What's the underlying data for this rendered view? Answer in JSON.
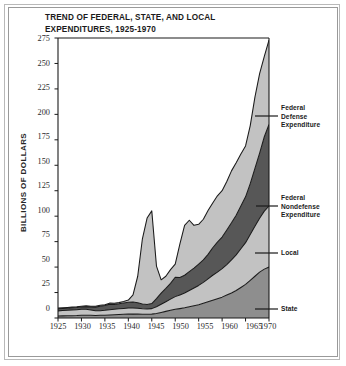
{
  "title": {
    "line1": "TREND OF FEDERAL, STATE, AND LOCAL",
    "line2": "EXPENDITURES, 1925-1970"
  },
  "axis": {
    "ylabel": "BILLIONS OF DOLLARS",
    "yticks": [
      "0",
      "25",
      "50",
      "75",
      "100",
      "125",
      "150",
      "175",
      "200",
      "225",
      "250",
      "275"
    ],
    "xticks": [
      "1925",
      "1930",
      "1935",
      "1940",
      "1945",
      "1950",
      "1955",
      "1960",
      "1965",
      "1970"
    ]
  },
  "annotations": {
    "federal_defense_l1": "Federal",
    "federal_defense_l2": "Defense",
    "federal_defense_l3": "Expenditure",
    "federal_nondefense_l1": "Federal",
    "federal_nondefense_l2": "Nondefense",
    "federal_nondefense_l3": "Expenditure",
    "local": "Local",
    "state": "State"
  },
  "colors": {
    "state": "#8e8e8e",
    "local": "#c2c2c2",
    "federal_nondefense": "#575757",
    "federal_defense": "#c2c2c2",
    "outline": "#1a1a1a",
    "axis": "#1a1a1a",
    "frame": "#9a9a9a",
    "text": "#1b1b1b",
    "background": "#ffffff"
  },
  "chart_data": {
    "type": "area",
    "stacked": true,
    "title": "TREND OF FEDERAL, STATE, AND LOCAL EXPENDITURES, 1925-1970",
    "xlabel": "",
    "ylabel": "BILLIONS OF DOLLARS",
    "xlim": [
      1925,
      1970
    ],
    "ylim": [
      0,
      275
    ],
    "grid": false,
    "legend_position": "right-inline-annotations",
    "x": [
      1925,
      1926,
      1927,
      1928,
      1929,
      1930,
      1931,
      1932,
      1933,
      1934,
      1935,
      1936,
      1937,
      1938,
      1939,
      1940,
      1941,
      1942,
      1943,
      1944,
      1945,
      1946,
      1947,
      1948,
      1949,
      1950,
      1951,
      1952,
      1953,
      1954,
      1955,
      1956,
      1957,
      1958,
      1959,
      1960,
      1961,
      1962,
      1963,
      1964,
      1965,
      1966,
      1967,
      1968,
      1969,
      1970
    ],
    "series": [
      {
        "name": "State",
        "color": "#8e8e8e",
        "values": [
          2.0,
          2.1,
          2.2,
          2.3,
          2.4,
          2.6,
          2.7,
          2.6,
          2.5,
          2.6,
          2.8,
          3.0,
          3.2,
          3.4,
          3.6,
          3.8,
          3.9,
          3.8,
          3.6,
          3.6,
          3.8,
          4.5,
          5.5,
          6.5,
          7.5,
          8.5,
          9.2,
          10.0,
          11.0,
          12.0,
          13.0,
          14.5,
          16.0,
          17.5,
          19.0,
          20.5,
          22.5,
          24.5,
          27.0,
          30.0,
          33.0,
          37.0,
          41.0,
          45.0,
          48.0,
          50.0
        ]
      },
      {
        "name": "Local",
        "color": "#c2c2c2",
        "values": [
          5.0,
          5.2,
          5.4,
          5.6,
          5.8,
          6.0,
          5.8,
          5.2,
          4.6,
          4.6,
          4.8,
          5.2,
          5.4,
          5.6,
          5.8,
          6.0,
          6.0,
          5.8,
          5.4,
          5.2,
          5.4,
          6.5,
          8.0,
          9.5,
          11.0,
          12.5,
          13.5,
          14.5,
          16.0,
          17.5,
          19.0,
          20.5,
          22.5,
          24.5,
          26.0,
          28.0,
          30.0,
          32.5,
          35.0,
          38.0,
          41.0,
          45.0,
          49.0,
          53.0,
          57.0,
          60.0
        ]
      },
      {
        "name": "Federal Nondefense Expenditure",
        "color": "#575757",
        "values": [
          2.0,
          2.0,
          2.0,
          2.1,
          2.1,
          2.2,
          2.6,
          3.0,
          3.6,
          4.4,
          4.6,
          5.4,
          4.8,
          5.0,
          5.4,
          5.6,
          5.8,
          5.4,
          4.8,
          4.4,
          5.0,
          8.0,
          11.0,
          13.0,
          15.5,
          19.0,
          17.0,
          17.5,
          18.5,
          19.5,
          21.0,
          22.0,
          24.0,
          27.0,
          29.5,
          31.0,
          34.0,
          36.5,
          39.0,
          42.0,
          45.0,
          50.0,
          57.0,
          64.0,
          73.0,
          80.0
        ]
      },
      {
        "name": "Federal Defense Expenditure",
        "color": "#c2c2c2",
        "values": [
          0.7,
          0.7,
          0.7,
          0.7,
          0.7,
          0.8,
          0.8,
          0.8,
          0.8,
          0.9,
          0.9,
          1.0,
          1.0,
          1.1,
          1.3,
          2.2,
          7.0,
          26.0,
          64.0,
          85.0,
          91.0,
          32.0,
          13.0,
          12.0,
          13.5,
          13.0,
          33.0,
          49.0,
          50.5,
          42.0,
          39.0,
          40.0,
          43.0,
          44.0,
          45.5,
          45.5,
          47.5,
          51.0,
          51.5,
          51.0,
          50.0,
          57.0,
          70.0,
          78.0,
          79.0,
          83.0
        ]
      }
    ],
    "totals": [
      9.7,
      10.0,
      10.3,
      10.7,
      11.0,
      11.6,
      11.9,
      11.6,
      11.5,
      12.5,
      13.1,
      14.6,
      14.4,
      15.1,
      16.1,
      17.6,
      22.7,
      41.0,
      77.8,
      98.2,
      105.2,
      51.0,
      37.5,
      41.0,
      47.5,
      53.0,
      72.7,
      91.0,
      96.0,
      91.0,
      92.0,
      97.0,
      105.5,
      113.0,
      120.0,
      125.0,
      134.0,
      144.5,
      152.5,
      161.0,
      169.0,
      189.0,
      217.0,
      240.0,
      257.0,
      273.0
    ]
  }
}
